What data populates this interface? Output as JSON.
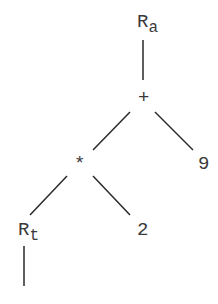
{
  "diagram": {
    "type": "expression-tree",
    "nodes": [
      {
        "id": "ra",
        "label": "R",
        "subscript": "a"
      },
      {
        "id": "plus",
        "label": "+"
      },
      {
        "id": "times",
        "label": "*"
      },
      {
        "id": "nine",
        "label": "9"
      },
      {
        "id": "rt",
        "label": "R",
        "subscript": "t"
      },
      {
        "id": "two",
        "label": "2"
      }
    ],
    "edges": [
      {
        "from": "ra",
        "to": "plus"
      },
      {
        "from": "plus",
        "to": "times"
      },
      {
        "from": "plus",
        "to": "nine"
      },
      {
        "from": "times",
        "to": "rt"
      },
      {
        "from": "times",
        "to": "two"
      },
      {
        "from": "rt",
        "to": "below"
      }
    ],
    "colors": {
      "stroke": "#2a2a2a",
      "text": "#3a3a3a",
      "background": "#ffffff"
    }
  }
}
